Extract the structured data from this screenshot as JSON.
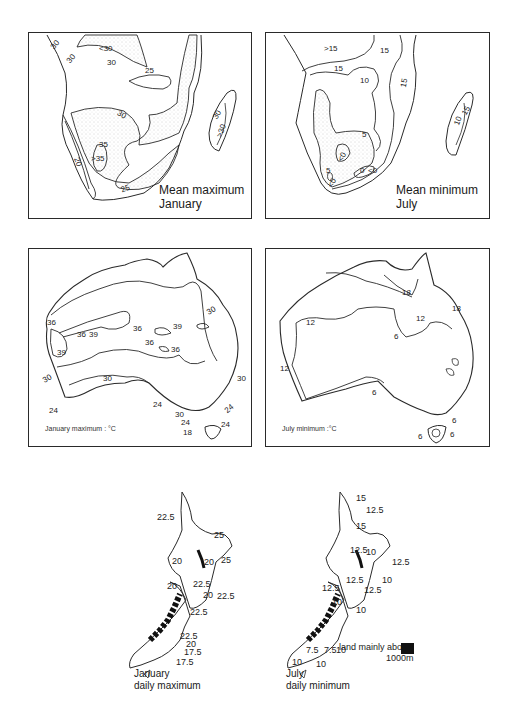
{
  "figure": {
    "panels": {
      "africa_jan_max": {
        "caption_line1": "Mean maximum",
        "caption_line2": "January",
        "contour_labels": [
          "30",
          "30",
          "<30",
          "30",
          "25",
          "30",
          "35",
          ">35",
          "20",
          "25",
          "30",
          ">30"
        ]
      },
      "africa_jul_min": {
        "caption_line1": "Mean minimum",
        "caption_line2": "July",
        "contour_labels": [
          ">15",
          "15",
          "15",
          "10",
          "15",
          "5",
          "<0",
          "0",
          "<0",
          "5",
          "<0",
          "15",
          "10"
        ]
      },
      "australia_jan_max": {
        "caption": "January maximum : °C",
        "contour_labels": [
          "36",
          "39",
          "36",
          "39",
          "36",
          "39",
          "36",
          "36",
          "30",
          "30",
          "24",
          "30",
          "24",
          "30",
          "24",
          "24",
          "24",
          "18",
          "30"
        ]
      },
      "australia_jul_min": {
        "caption": "July minimum :°C",
        "contour_labels": [
          "18",
          "18",
          "12",
          "12",
          "6",
          "12",
          "6",
          "6",
          "6",
          "6"
        ]
      },
      "nz_jan_max": {
        "caption_line1": "January",
        "caption_line2": "daily maximum",
        "contour_labels": [
          "22.5",
          "25",
          "20",
          "20",
          "25",
          "20",
          "22.5",
          "20",
          "22.5",
          "22.5",
          "22.5",
          "20",
          "17.5",
          "17.5"
        ]
      },
      "nz_jul_min": {
        "caption_line1": "July",
        "caption_line2": "daily minimum",
        "contour_labels": [
          "15",
          "12.5",
          "15",
          "12.5",
          "10",
          "12.5",
          "12.5",
          "10",
          "12.5",
          "12.5",
          "10",
          "10",
          "7.5",
          "7.5",
          "10",
          "10",
          "10"
        ],
        "legend_label_line1": "land mainly above",
        "legend_label_line2": "1000m",
        "legend_color": "#111111"
      }
    },
    "colors": {
      "line": "#2a2a2a",
      "stipple": "#9a9a9a",
      "background": "#ffffff"
    }
  }
}
